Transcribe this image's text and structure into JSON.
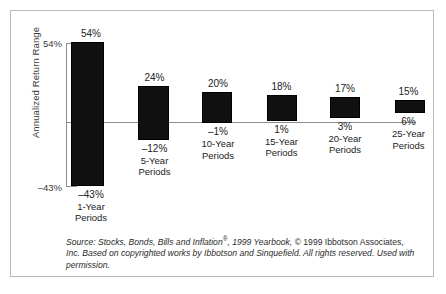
{
  "chart_data": {
    "type": "bar",
    "subtype": "floating-range-bar",
    "title": "",
    "xlabel": "",
    "ylabel": "Annualized Return Range",
    "ylim": [
      -43,
      54
    ],
    "grid": false,
    "legend": null,
    "zero_line": 0,
    "axis_ticks": {
      "max_label": "54%",
      "min_label": "–43%"
    },
    "categories": [
      "1-Year Periods",
      "5-Year Periods",
      "10-Year Periods",
      "15-Year Periods",
      "20-Year Periods",
      "25-Year Periods"
    ],
    "series": [
      {
        "name": "High",
        "values": [
          54,
          24,
          20,
          18,
          17,
          15
        ]
      },
      {
        "name": "Low",
        "values": [
          -43,
          -12,
          -1,
          1,
          3,
          6
        ]
      }
    ],
    "bars": [
      {
        "period_line1": "1-Year",
        "period_line2": "Periods",
        "high": 54,
        "low": -43,
        "high_label": "54%",
        "low_label": "–43%"
      },
      {
        "period_line1": "5-Year",
        "period_line2": "Periods",
        "high": 24,
        "low": -12,
        "high_label": "24%",
        "low_label": "–12%"
      },
      {
        "period_line1": "10-Year",
        "period_line2": "Periods",
        "high": 20,
        "low": -1,
        "high_label": "20%",
        "low_label": "–1%"
      },
      {
        "period_line1": "15-Year",
        "period_line2": "Periods",
        "high": 18,
        "low": 1,
        "high_label": "18%",
        "low_label": "1%"
      },
      {
        "period_line1": "20-Year",
        "period_line2": "Periods",
        "high": 17,
        "low": 3,
        "high_label": "17%",
        "low_label": "3%"
      },
      {
        "period_line1": "25-Year",
        "period_line2": "Periods",
        "high": 15,
        "low": 6,
        "high_label": "15%",
        "low_label": "6%"
      }
    ],
    "colors": {
      "bar": "#111111",
      "axis": "#8d8d8d",
      "text": "#222222",
      "frame": "#b9b9b9"
    }
  },
  "source_note": {
    "lead": "Source: Stocks, Bonds, Bills and Inflation",
    "registered_mark": "®",
    "middle": ", 1999 Yearbook, ",
    "copyright": "© 1999 Ibbotson Associates,",
    "line2": "Inc. Based on copyrighted works by Ibbotson and Sinquefield. All rights reserved.",
    "line3": "Used with permission."
  }
}
